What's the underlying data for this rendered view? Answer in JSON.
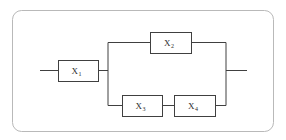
{
  "diagram": {
    "type": "reliability-block-diagram",
    "frame": {
      "name": "outer-frame",
      "x": 12,
      "y": 10,
      "width": 261,
      "height": 121,
      "radius": 9,
      "stroke": "#b9b9b9",
      "fill": "#ffffff"
    },
    "style": {
      "block_stroke": "#404040",
      "block_fill": "#ffffff",
      "wire_stroke": "#404040",
      "text_color": "#2b2b2b"
    },
    "blocks": [
      {
        "id": "x1",
        "label": "X",
        "subscript": "1",
        "x": 58,
        "y": 60,
        "width": 40,
        "height": 21
      },
      {
        "id": "x2",
        "label": "X",
        "subscript": "2",
        "x": 150,
        "y": 32,
        "width": 41,
        "height": 21
      },
      {
        "id": "x3",
        "label": "X",
        "subscript": "3",
        "x": 122,
        "y": 95,
        "width": 40,
        "height": 21
      },
      {
        "id": "x4",
        "label": "X",
        "subscript": "4",
        "x": 174,
        "y": 95,
        "width": 41,
        "height": 21
      }
    ],
    "wires": [
      {
        "id": "input-lead",
        "d": "M 40 70.5 L 58 70.5"
      },
      {
        "id": "x1-to-split",
        "d": "M 98 70.5 L 108 70.5"
      },
      {
        "id": "split-vertical",
        "d": "M 108 42.5 L 108 105.5"
      },
      {
        "id": "split-to-x2",
        "d": "M 108 42.5 L 150 42.5"
      },
      {
        "id": "x2-to-merge",
        "d": "M 191 42.5 L 226 42.5"
      },
      {
        "id": "split-to-x3",
        "d": "M 108 105.5 L 122 105.5"
      },
      {
        "id": "x3-to-x4",
        "d": "M 162 105.5 L 174 105.5"
      },
      {
        "id": "x4-to-merge",
        "d": "M 215 105.5 L 226 105.5"
      },
      {
        "id": "merge-vertical",
        "d": "M 226 42.5 L 226 105.5"
      },
      {
        "id": "output-lead",
        "d": "M 226 70.5 L 247 70.5"
      }
    ]
  }
}
